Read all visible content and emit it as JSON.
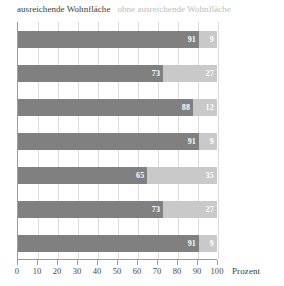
{
  "chart_data": {
    "type": "bar",
    "orientation": "horizontal",
    "stacked": true,
    "title": "",
    "xlabel": "Prozent",
    "ylabel": "",
    "xlim": [
      0,
      100
    ],
    "xticks": [
      0,
      10,
      20,
      30,
      40,
      50,
      60,
      70,
      80,
      90,
      100
    ],
    "xtick_labels": [
      "0",
      "10",
      "20",
      "30",
      "40",
      "50",
      "60",
      "70",
      "80",
      "90",
      "100"
    ],
    "grid": true,
    "grid_axis": "x",
    "legend_position": "top-left",
    "categories": [
      "",
      "",
      "",
      "",
      "",
      "",
      ""
    ],
    "series": [
      {
        "name": "ausreichende Wohnfläche",
        "color": "#808080",
        "values": [
          91,
          73,
          88,
          91,
          65,
          73,
          91
        ]
      },
      {
        "name": "ohne ausreichende Wohnfläche",
        "color": "#c9c9c9",
        "values": [
          9,
          27,
          12,
          9,
          35,
          27,
          9
        ]
      }
    ],
    "bars": [
      {
        "main": 91,
        "other": 9
      },
      {
        "main": 73,
        "other": 27
      },
      {
        "main": 88,
        "other": 12
      },
      {
        "main": 91,
        "other": 9
      },
      {
        "main": 65,
        "other": 35
      },
      {
        "main": 73,
        "other": 27
      },
      {
        "main": 91,
        "other": 9
      }
    ]
  },
  "legend": {
    "items": [
      {
        "label": "ausreichende Wohnfläche",
        "color": "#3b3b3b"
      },
      {
        "label": "ohne ausreichende Wohnfläche",
        "color": "#bcbcbc"
      }
    ]
  },
  "axis": {
    "title": "Prozent",
    "ticks": [
      "0",
      "10",
      "20",
      "30",
      "40",
      "50",
      "60",
      "70",
      "80",
      "90",
      "100"
    ]
  },
  "colors": {
    "bar_main": "#808080",
    "bar_other": "#c9c9c9",
    "gridline": "#dcdcdc",
    "axis_line": "#9a9a9a",
    "value_text": "#ffffff"
  }
}
